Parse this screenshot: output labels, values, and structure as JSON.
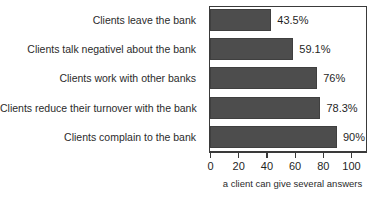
{
  "chart_data": {
    "type": "bar",
    "orientation": "horizontal",
    "title": "",
    "xlabel": "",
    "ylabel": "",
    "xlim": [
      0,
      100
    ],
    "grid": false,
    "legend": null,
    "categories": [
      "Clients leave the bank",
      "Clients talk negativel about the bank",
      "Clients work with other banks",
      "Clients reduce their turnover with the bank",
      "Clients complain to the bank"
    ],
    "values": [
      43.5,
      59.1,
      76,
      78.3,
      90
    ],
    "value_labels": [
      "43.5%",
      "59.1%",
      "76%",
      "78.3%",
      "90%"
    ],
    "xticks": [
      0,
      20,
      40,
      60,
      80,
      100
    ],
    "xtick_labels": [
      "0",
      "20",
      "40",
      "60",
      "80",
      "100"
    ],
    "annotation": "a client can give several answers",
    "bar_color": "#4d4d4d",
    "axis_color": "#3a3a3a",
    "background_color": "#ffffff"
  }
}
